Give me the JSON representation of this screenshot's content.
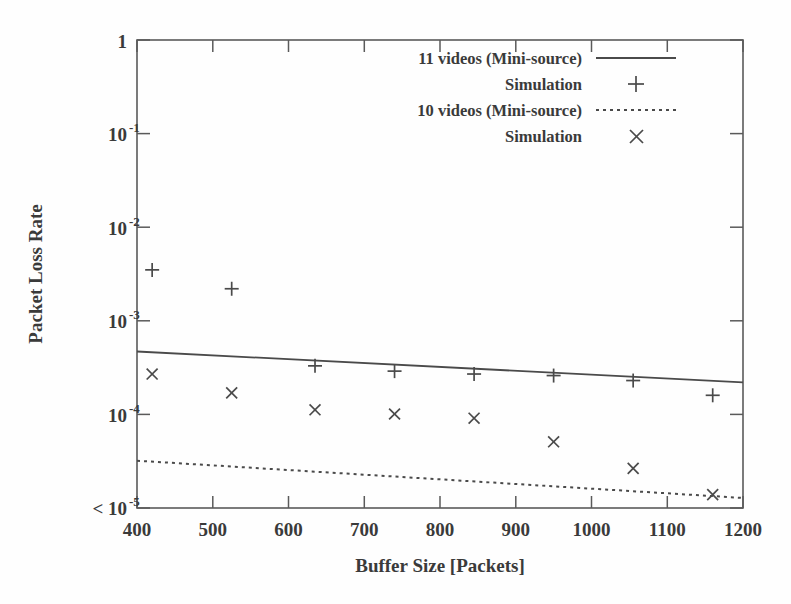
{
  "chart_data": {
    "type": "scatter",
    "title": "",
    "xlabel": "Buffer Size [Packets]",
    "ylabel": "Packet Loss Rate",
    "xlim": [
      400,
      1200
    ],
    "ylim": [
      1e-05,
      1
    ],
    "yscale": "log",
    "grid": false,
    "xticks": [
      400,
      500,
      600,
      700,
      800,
      900,
      1000,
      1100,
      1200
    ],
    "xticklabels": [
      "400",
      "500",
      "600",
      "700",
      "800",
      "900",
      "1000",
      "1100",
      "1200"
    ],
    "yticks": [
      1,
      0.1,
      0.01,
      0.001,
      0.0001,
      1e-05
    ],
    "yticklabels": [
      "1",
      "10-1",
      "10-2",
      "10-3",
      "10-4",
      "< 10-5"
    ],
    "ytick_bases": [
      "1",
      "10",
      "10",
      "10",
      "10",
      "< 10"
    ],
    "ytick_exponents": [
      "",
      "-1",
      "-2",
      "-3",
      "-4",
      "-5"
    ],
    "legend_position": "top-center-right",
    "series": [
      {
        "name": "11 videos (Mini-source)",
        "style": "solid-line",
        "marker": "none",
        "x": [
          400,
          1200
        ],
        "values": [
          0.00047,
          0.00022
        ]
      },
      {
        "name": "Simulation",
        "style": "points",
        "marker": "plus",
        "x": [
          420,
          525,
          635,
          740,
          845,
          950,
          1055,
          1160
        ],
        "values": [
          0.0035,
          0.0022,
          0.00033,
          0.00029,
          0.00027,
          0.00026,
          0.00023,
          0.00016
        ]
      },
      {
        "name": "10 videos (Mini-source)",
        "style": "dotted-line",
        "marker": "none",
        "x": [
          400,
          1200
        ],
        "values": [
          3.2e-05,
          1.28e-05
        ]
      },
      {
        "name": "Simulation",
        "style": "points",
        "marker": "cross",
        "x": [
          420,
          525,
          635,
          740,
          845,
          950,
          1055,
          1160
        ],
        "values": [
          0.00027,
          0.00017,
          0.000112,
          0.000101,
          9.1e-05,
          5.1e-05,
          2.65e-05,
          1.39e-05
        ]
      }
    ]
  },
  "legend": {
    "entries": [
      {
        "label": "11 videos (Mini-source)",
        "key": "solid-line"
      },
      {
        "label": "Simulation",
        "key": "plus-marker"
      },
      {
        "label": "10 videos (Mini-source)",
        "key": "dotted-line"
      },
      {
        "label": "Simulation",
        "key": "cross-marker"
      }
    ]
  },
  "colors": {
    "ink": "#3a3a3a",
    "line": "#4a4a4a",
    "frame": "#5a5a5a",
    "background": "#fefefe"
  }
}
